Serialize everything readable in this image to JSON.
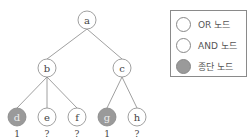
{
  "tree": {
    "nodes": [
      {
        "id": "a",
        "label": "a",
        "type": "or",
        "x": 87,
        "y": 20
      },
      {
        "id": "b",
        "label": "b",
        "type": "or",
        "x": 47,
        "y": 68
      },
      {
        "id": "c",
        "label": "c",
        "type": "or",
        "x": 122,
        "y": 68
      },
      {
        "id": "d",
        "label": "d",
        "type": "terminal",
        "x": 17,
        "y": 117,
        "value": "1"
      },
      {
        "id": "e",
        "label": "e",
        "type": "or",
        "x": 47,
        "y": 117,
        "value": "?"
      },
      {
        "id": "f",
        "label": "f",
        "type": "or",
        "x": 77,
        "y": 117,
        "value": "?"
      },
      {
        "id": "g",
        "label": "g",
        "type": "terminal",
        "x": 107,
        "y": 117,
        "value": "1"
      },
      {
        "id": "h",
        "label": "h",
        "type": "or",
        "x": 137,
        "y": 117,
        "value": "?"
      }
    ],
    "edges": [
      [
        "a",
        "b"
      ],
      [
        "a",
        "c"
      ],
      [
        "b",
        "d"
      ],
      [
        "b",
        "e"
      ],
      [
        "b",
        "f"
      ],
      [
        "c",
        "g"
      ],
      [
        "c",
        "h"
      ]
    ],
    "colors": {
      "stroke": "#888888",
      "terminal_fill": "#9a9a9a",
      "text": "#444444"
    }
  },
  "legend": {
    "items": [
      {
        "label": "OR 노드",
        "type": "or"
      },
      {
        "label": "AND 노드",
        "type": "and"
      },
      {
        "label": "종단 노드",
        "type": "terminal"
      }
    ]
  }
}
